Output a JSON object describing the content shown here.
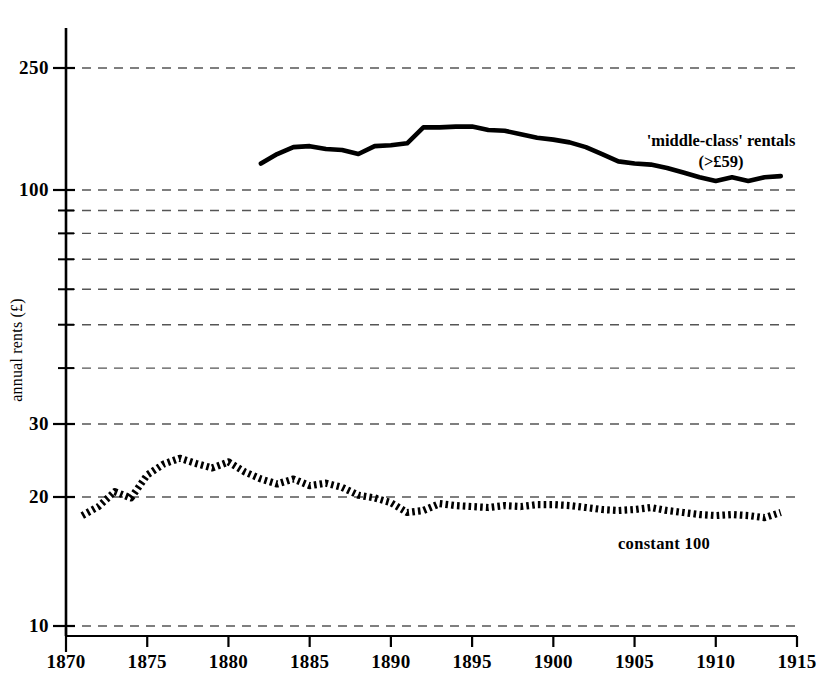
{
  "chart_data": {
    "type": "line",
    "title": "",
    "xlabel": "",
    "ylabel": "annual rents (£)",
    "yscale": "log",
    "grid": true,
    "legend_position": "inline-annotations",
    "xlim": [
      1870,
      1915
    ],
    "ylim": [
      10,
      270
    ],
    "x_ticks": [
      1870,
      1875,
      1880,
      1885,
      1890,
      1895,
      1900,
      1905,
      1910,
      1915
    ],
    "y_ticks_labeled": [
      250,
      100,
      30,
      20,
      10
    ],
    "y_gridlines_unlabeled": [
      90,
      80,
      70,
      60,
      50,
      40
    ],
    "series": [
      {
        "name": "'middle-class' rentals (>£59)",
        "style": "solid",
        "x": [
          1882,
          1883,
          1884,
          1885,
          1886,
          1887,
          1888,
          1889,
          1890,
          1891,
          1892,
          1893,
          1894,
          1895,
          1896,
          1897,
          1898,
          1899,
          1900,
          1901,
          1902,
          1903,
          1904,
          1905,
          1906,
          1907,
          1908,
          1909,
          1910,
          1911,
          1912,
          1913,
          1914
        ],
        "values": [
          122,
          131,
          138,
          139,
          136,
          135,
          131,
          139,
          140,
          142,
          160,
          160,
          161,
          161,
          157,
          156,
          152,
          148,
          146,
          143,
          138,
          131,
          124,
          122,
          121,
          118,
          114,
          110,
          107,
          110,
          107,
          110,
          111
        ]
      },
      {
        "name": "constant 100",
        "style": "dotted",
        "x": [
          1871,
          1872,
          1873,
          1874,
          1875,
          1876,
          1877,
          1878,
          1879,
          1880,
          1881,
          1882,
          1883,
          1884,
          1885,
          1886,
          1887,
          1888,
          1889,
          1890,
          1891,
          1892,
          1893,
          1894,
          1895,
          1896,
          1897,
          1898,
          1899,
          1900,
          1901,
          1902,
          1903,
          1904,
          1905,
          1906,
          1907,
          1908,
          1909,
          1910,
          1911,
          1912,
          1913,
          1914
        ],
        "values": [
          18.1,
          19.0,
          20.6,
          19.9,
          22.6,
          24.0,
          24.8,
          24.1,
          23.5,
          24.3,
          23.0,
          22.1,
          21.5,
          22.1,
          21.3,
          21.6,
          21.1,
          20.2,
          19.9,
          19.4,
          18.4,
          18.6,
          19.3,
          19.1,
          19.0,
          18.9,
          19.1,
          19.0,
          19.2,
          19.2,
          19.1,
          18.9,
          18.7,
          18.6,
          18.7,
          18.9,
          18.6,
          18.4,
          18.2,
          18.1,
          18.2,
          18.1,
          17.9,
          18.4
        ]
      }
    ],
    "annotations": [
      {
        "name": "middle-class-rentals",
        "line1": "'middle-class' rentals",
        "line2": "(>£59)"
      },
      {
        "name": "constant-100",
        "text": "constant 100"
      }
    ]
  },
  "axis": {
    "y_title": "annual rents (£)",
    "y_labels": [
      "250",
      "100",
      "30",
      "20",
      "10"
    ],
    "x_labels": [
      "1870",
      "1875",
      "1880",
      "1885",
      "1890",
      "1895",
      "1900",
      "1905",
      "1910",
      "1915"
    ]
  },
  "annotations": {
    "middle_class_line1": "'middle-class' rentals",
    "middle_class_line2": "(>£59)",
    "constant_100": "constant 100"
  },
  "colors": {
    "ink": "#000000",
    "grid": "#555555",
    "background": "#ffffff"
  }
}
